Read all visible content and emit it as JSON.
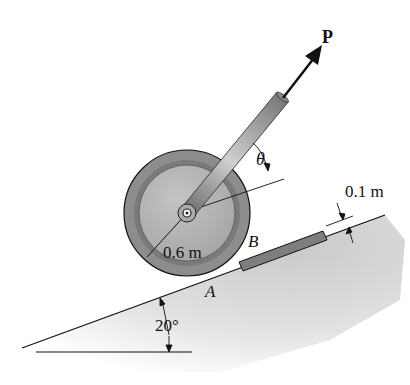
{
  "diagram": {
    "labels": {
      "force": "P",
      "angle_theta": "θ",
      "wheel_radius": "0.6 m",
      "point_b": "B",
      "point_a": "A",
      "block_thickness": "0.1 m",
      "incline_angle": "20°"
    },
    "colors": {
      "wheel_rim": "#8a8a8a",
      "wheel_inner": "#b8b8b8",
      "rod": "#9a9a9a",
      "block": "#7e7e7e",
      "ground_shade": "#d6d6d6",
      "line": "#111111"
    }
  }
}
